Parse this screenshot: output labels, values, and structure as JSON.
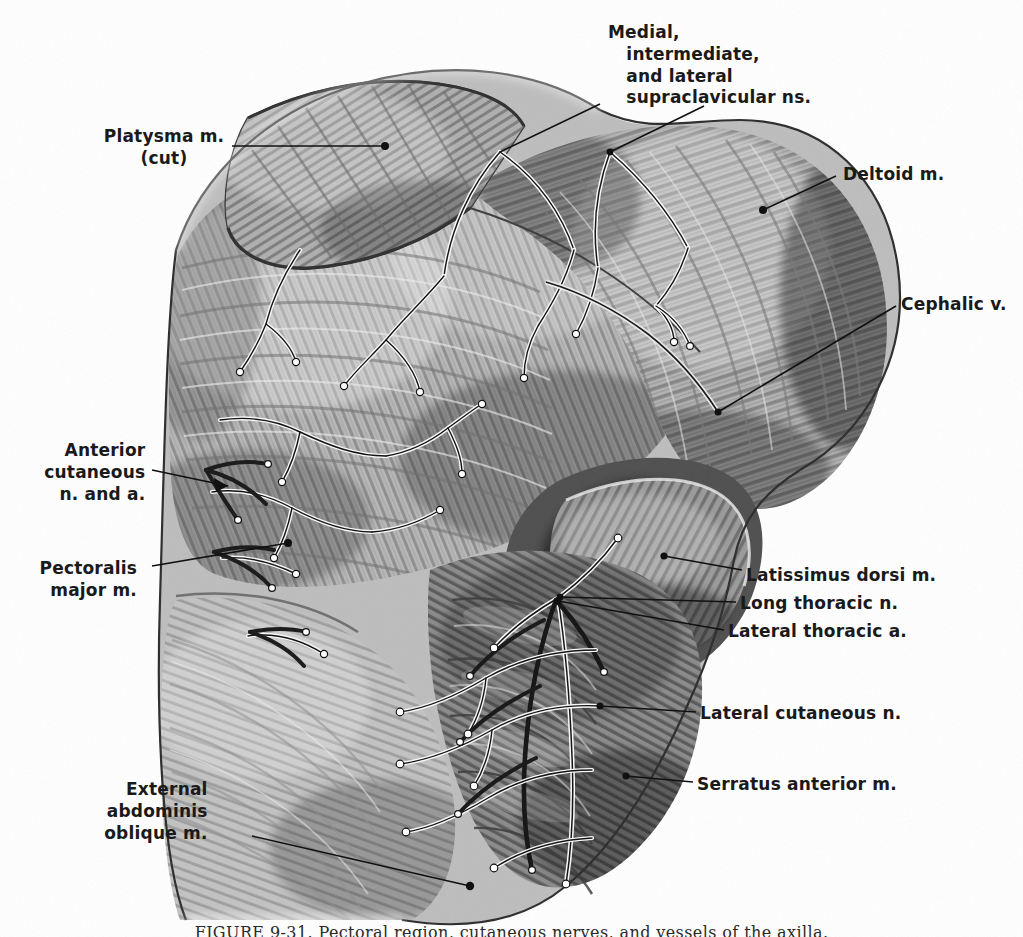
{
  "plate": {
    "title": "Anterior thoracic wall and axilla — superficial dissection",
    "medium": "grayscale halftone anatomical illustration",
    "background_color": "#ffffff",
    "ink_color": "#111111",
    "width": 1023,
    "height": 937
  },
  "caption": {
    "text": "FIGURE  9-31.    Pectoral region, cutaneous nerves, and vessels of the axilla."
  },
  "labels": [
    {
      "id": "supraclavicular-ns",
      "lines": [
        "Medial,",
        "   intermediate,",
        "   and lateral",
        "   supraclavicular ns."
      ],
      "align": "center",
      "x": 608,
      "y": 22
    },
    {
      "id": "platysma",
      "lines": [
        "Platysma m.",
        "(cut)"
      ],
      "align": "left",
      "x": 96,
      "y": 126
    },
    {
      "id": "deltoid",
      "lines": [
        "Deltoid m."
      ],
      "align": "right",
      "x": 843,
      "y": 164
    },
    {
      "id": "cephalic-v",
      "lines": [
        "Cephalic v."
      ],
      "align": "right",
      "x": 901,
      "y": 294
    },
    {
      "id": "anterior-cutaneous",
      "lines": [
        "Anterior",
        "  cutaneous",
        "  n. and a."
      ],
      "align": "left",
      "x": 32,
      "y": 440
    },
    {
      "id": "pectoralis-major",
      "lines": [
        "Pectoralis",
        "  major m."
      ],
      "align": "left",
      "x": 38,
      "y": 558
    },
    {
      "id": "latissimus-dorsi",
      "lines": [
        "Latissimus dorsi m."
      ],
      "align": "right",
      "x": 746,
      "y": 565
    },
    {
      "id": "long-thoracic-n",
      "lines": [
        "Long thoracic n."
      ],
      "align": "right",
      "x": 740,
      "y": 597
    },
    {
      "id": "lateral-thoracic-a",
      "lines": [
        "Lateral thoracic a."
      ],
      "align": "right",
      "x": 728,
      "y": 625
    },
    {
      "id": "lateral-cutaneous-n",
      "lines": [
        "Lateral cutaneous n."
      ],
      "align": "right",
      "x": 700,
      "y": 706
    },
    {
      "id": "serratus-anterior",
      "lines": [
        "Serratus anterior m."
      ],
      "align": "right",
      "x": 697,
      "y": 777
    },
    {
      "id": "external-abdominis-oblique",
      "lines": [
        "External",
        "  abdominis",
        "  oblique m."
      ],
      "align": "left",
      "x": 92,
      "y": 779
    }
  ],
  "leaders": [
    {
      "id": "leader-supraclavicular",
      "path": "M 600 104 L 506 148",
      "dot": null
    },
    {
      "id": "leader-supraclavicular-2",
      "path": "M 700 108 L 612 152",
      "dot": [
        612,
        152
      ]
    },
    {
      "id": "leader-platysma",
      "path": "M 232 146 L 385 146",
      "dot": [
        385,
        146
      ]
    },
    {
      "id": "leader-deltoid",
      "path": "M 836 176 L 763 210",
      "dot": [
        763,
        210
      ]
    },
    {
      "id": "leader-cephalic",
      "path": "M 896 306 L 718 412",
      "dot": [
        718,
        412
      ]
    },
    {
      "id": "leader-anterior-cut",
      "path": "M 150 470 L 232 486",
      "dot": null,
      "arrow": true
    },
    {
      "id": "leader-pectoralis",
      "path": "M 152 566 L 288 543",
      "dot": [
        288,
        543
      ]
    },
    {
      "id": "leader-latissimus",
      "path": "M 742 570 L 660 556",
      "dot": [
        660,
        556
      ]
    },
    {
      "id": "leader-long-thoracic",
      "path": "M 734 602 L 558 598",
      "dot": [
        558,
        598
      ]
    },
    {
      "id": "leader-lateral-thoracic",
      "path": "M 722 630 L 556 600",
      "dot": [
        556,
        600
      ]
    },
    {
      "id": "leader-lateral-cut",
      "path": "M 694 712 L 600 706",
      "dot": [
        600,
        706
      ]
    },
    {
      "id": "leader-serratus",
      "path": "M 691 782 L 626 776",
      "dot": [
        626,
        776
      ]
    },
    {
      "id": "leader-ext-oblique",
      "path": "M 252 836 L 470 886",
      "dot": [
        470,
        886
      ]
    }
  ]
}
